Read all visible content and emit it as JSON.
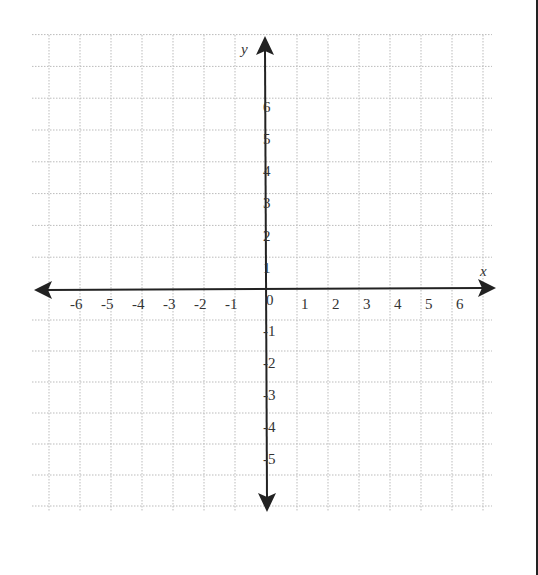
{
  "diagram": {
    "type": "coordinate-plane",
    "x_axis": {
      "name": "x",
      "min": -6,
      "max": 6,
      "tick_labels": [
        "-6",
        "-5",
        "-4",
        "-3",
        "-2",
        "-1",
        "1",
        "2",
        "3",
        "4",
        "5",
        "6"
      ],
      "origin_label": "0"
    },
    "y_axis": {
      "name": "y",
      "min": -5,
      "max": 6,
      "positive_labels": [
        "1",
        "2",
        "3",
        "4",
        "5",
        "6"
      ],
      "negative_labels": [
        "-1",
        "-2",
        "-3",
        "-4",
        "-5"
      ]
    },
    "grid": {
      "style": "dotted",
      "color": "#bbbbbb",
      "cell_size": 31
    },
    "axis_color": "#222222",
    "label_color": "#333333"
  }
}
